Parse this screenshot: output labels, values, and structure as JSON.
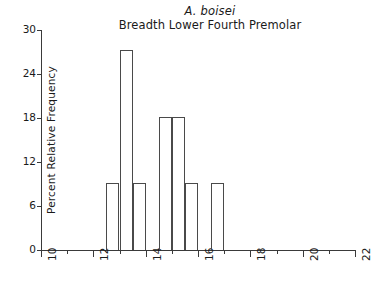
{
  "chart_data": {
    "type": "bar",
    "title": "Breadth Lower Fourth Premolar",
    "subtitle": "A. boisei",
    "species_label": "A. boisei",
    "xlabel": "",
    "ylabel": "Percent Relative Frequency",
    "xlim": [
      10,
      22
    ],
    "ylim": [
      0,
      30
    ],
    "grid": false,
    "legend": null,
    "bin_width": 0.5,
    "x_major_ticks": [
      10,
      12,
      14,
      16,
      18,
      20,
      22
    ],
    "x_minor_ticks": [
      11,
      13,
      15,
      17,
      19,
      21
    ],
    "x_tick_labels": [
      "10",
      "12",
      "14",
      "16",
      "18",
      "20",
      "22"
    ],
    "y_ticks": [
      0,
      6,
      12,
      18,
      24,
      30
    ],
    "y_tick_labels": [
      "0",
      "6",
      "12",
      "18",
      "24",
      "30"
    ],
    "bin_starts": [
      12.5,
      13.0,
      13.5,
      14.0,
      14.5,
      15.0,
      15.5,
      16.0,
      16.5,
      17.0,
      17.5,
      18.0
    ],
    "bin_ends": [
      13.0,
      13.5,
      14.0,
      14.5,
      15.0,
      15.5,
      16.0,
      16.5,
      17.0,
      17.5,
      18.0,
      18.5
    ],
    "categories": [
      "12.5-13.0",
      "13.0-13.5",
      "13.5-14.0",
      "14.0-14.5",
      "14.5-15.0",
      "15.0-15.5",
      "15.5-16.0",
      "16.0-16.5",
      "16.5-17.0",
      "17.0-17.5",
      "17.5-18.0",
      "18.0-18.5"
    ],
    "values": [
      9.1,
      27.3,
      9.1,
      0,
      18.2,
      18.2,
      9.1,
      0,
      9.1,
      0,
      0,
      0
    ]
  }
}
